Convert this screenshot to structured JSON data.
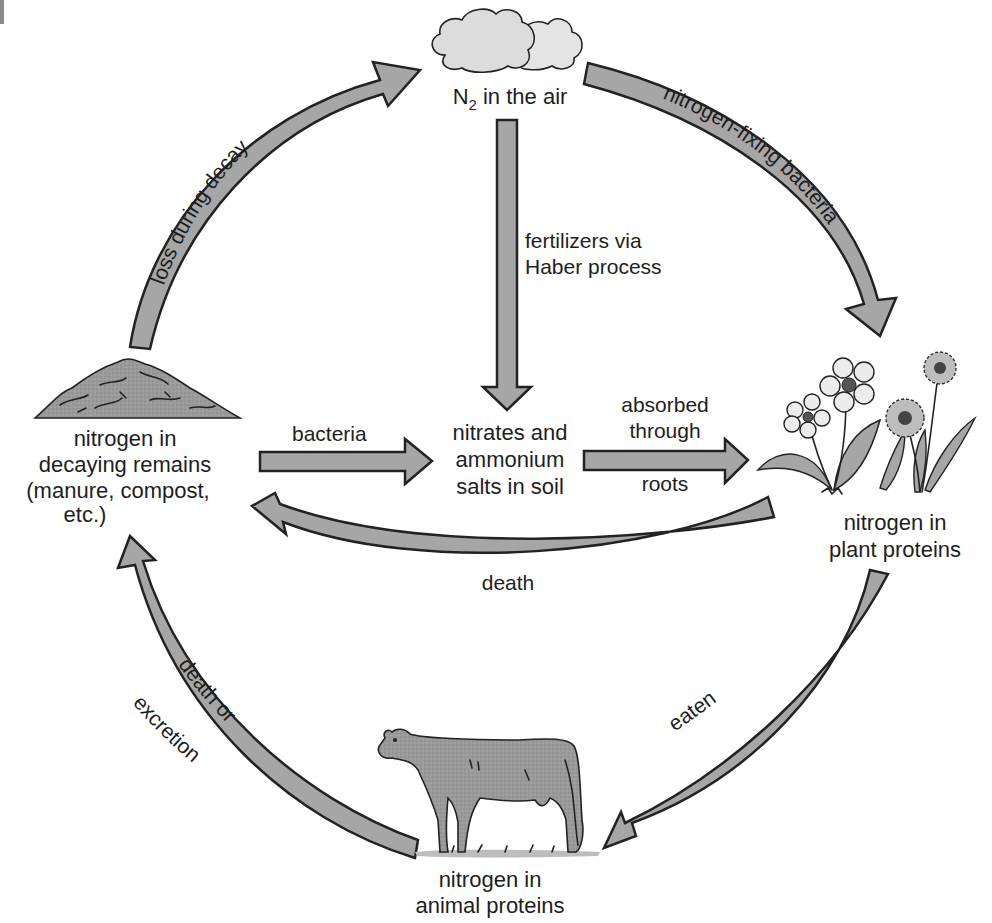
{
  "diagram": {
    "colors": {
      "arrow_fill": "#a6a6a6",
      "arrow_stroke": "#222222",
      "illustration_fill": "#9a9a9a",
      "cloud_fill": "#dcdcdc",
      "flower_fill": "#e6e6e6",
      "text": "#1e1e1e"
    },
    "nodes": {
      "air": {
        "prefix": "N",
        "subscript": "2",
        "suffix": " in the air",
        "icon": "cloud-icon"
      },
      "decaying_remains": {
        "lines": [
          "nitrogen in",
          "decaying remains",
          "(manure, compost,",
          "etc.)"
        ],
        "icon": "compost-pile-icon"
      },
      "soil": {
        "lines": [
          "nitrates and",
          "ammonium",
          "salts in soil"
        ]
      },
      "plant_proteins": {
        "lines": [
          "nitrogen in",
          "plant proteins"
        ],
        "icon": "flowers-icon"
      },
      "animal_proteins": {
        "lines": [
          "nitrogen in",
          "animal proteins"
        ],
        "icon": "cow-icon"
      }
    },
    "edges": {
      "loss_during_decay": {
        "label": "loss during decay",
        "from": "decaying_remains",
        "to": "air"
      },
      "nitrogen_fixing": {
        "label": "nitrogen-fixing bacteria",
        "from": "air",
        "to": "plant_proteins"
      },
      "haber": {
        "lines": [
          "fertilizers via",
          "Haber process"
        ],
        "from": "air",
        "to": "soil"
      },
      "bacteria": {
        "label": "bacteria",
        "from": "decaying_remains",
        "to": "soil"
      },
      "absorbed": {
        "lines": [
          "absorbed",
          "through",
          "roots"
        ],
        "from": "soil",
        "to": "plant_proteins"
      },
      "death": {
        "label": "death",
        "from": "plant_proteins",
        "to": "decaying_remains"
      },
      "eaten": {
        "label": "eaten",
        "from": "plant_proteins",
        "to": "animal_proteins"
      },
      "death_or_excretion": {
        "lines": [
          "death or",
          "excretion"
        ],
        "from": "animal_proteins",
        "to": "decaying_remains"
      }
    }
  }
}
